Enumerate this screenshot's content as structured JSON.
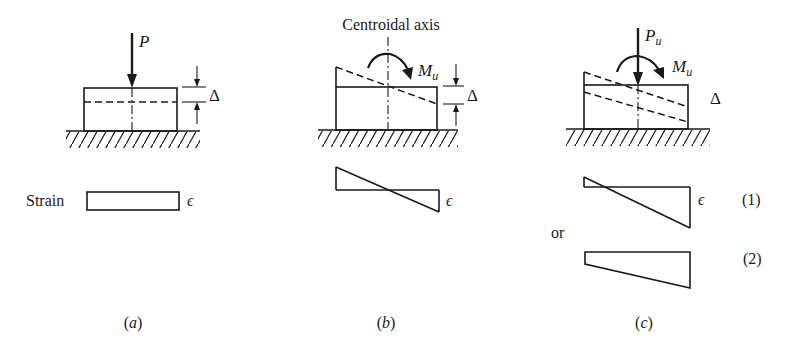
{
  "figure": {
    "panels": [
      {
        "id": "a",
        "caption": "(a)",
        "caption_letter": "a",
        "load_label": "P",
        "delta_label": "Δ",
        "strain_row_label": "Strain",
        "strain_symbol": "ϵ",
        "strain_shape": "uniform rectangle"
      },
      {
        "id": "b",
        "caption": "(b)",
        "caption_letter": "b",
        "axis_label": "Centroidal axis",
        "moment_label": "M",
        "moment_subscript": "u",
        "delta_label": "Δ",
        "strain_symbol": "ϵ",
        "strain_shape": "linear, zero at centroid (pure bending)"
      },
      {
        "id": "c",
        "caption": "(c)",
        "caption_letter": "c",
        "load_label": "P",
        "load_subscript": "u",
        "moment_label": "M",
        "moment_subscript": "u",
        "delta_label": "Δ",
        "strain_symbol": "ϵ",
        "alternative_word": "or",
        "strain_cases": [
          {
            "label": "(1)",
            "shape": "linear, small tension at top"
          },
          {
            "label": "(2)",
            "shape": "linear trapezoid, all compression"
          }
        ]
      }
    ]
  },
  "colors": {
    "ink": "#1a1a1a",
    "background": "#ffffff"
  }
}
